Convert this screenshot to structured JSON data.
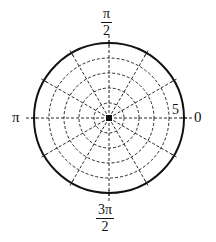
{
  "chart_data": {
    "type": "polar-grid",
    "title": "",
    "center_px": [
      109,
      118
    ],
    "outer_radius_px": 75,
    "radial_range": [
      0,
      5
    ],
    "circle_radii": [
      1,
      2,
      3,
      4,
      5
    ],
    "outer_circle_style": "solid",
    "inner_circle_style": "dashed",
    "radial_line_angles_deg": [
      0,
      30,
      60,
      90,
      120,
      150,
      180,
      210,
      240,
      270,
      300,
      330
    ],
    "radial_line_style": "dashed",
    "radius_tick_label": "5",
    "angle_labels": [
      {
        "angle": "0",
        "num": "",
        "den": "",
        "text": "0"
      },
      {
        "angle": "pi/2",
        "num": "π",
        "den": "2"
      },
      {
        "angle": "pi",
        "text": "π"
      },
      {
        "angle": "3pi/2",
        "num": "3π",
        "den": "2"
      }
    ],
    "grid": true,
    "legend": null,
    "series": []
  },
  "labels": {
    "zero": "0",
    "pi": "π",
    "half_pi_num": "π",
    "half_pi_den": "2",
    "three_half_pi_num": "3π",
    "three_half_pi_den": "2",
    "radius_five": "5"
  },
  "colors": {
    "line": "#111111",
    "background": "#ffffff"
  }
}
